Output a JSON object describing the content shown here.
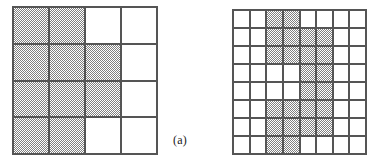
{
  "figure": {
    "panel_label": "(a)",
    "colors": {
      "grid_line": "#555555",
      "shade_fill": "#808080",
      "empty_fill": "#ffffff",
      "label_text": "#1a1a1a"
    }
  },
  "chart_data": {
    "type": "heatmap",
    "title": "",
    "subtitle": "",
    "xlabel": "",
    "ylabel": "",
    "grid": true,
    "legend": "none",
    "annotations": [
      {
        "text": "(a)",
        "x": 173,
        "y": 133
      }
    ],
    "panels": [
      {
        "name": "coarse-grid",
        "rows": 8,
        "cols": 8,
        "display_rows": 4,
        "display_cols": 4,
        "cell_values_note": "1 = shaded cell, 0 = empty cell; row order top to bottom, column order left to right",
        "cells": [
          [
            1,
            1,
            0,
            0
          ],
          [
            1,
            1,
            1,
            0
          ],
          [
            1,
            1,
            1,
            0
          ],
          [
            1,
            1,
            0,
            0
          ]
        ],
        "shaded_count": 10,
        "total_count": 16
      },
      {
        "name": "fine-grid",
        "rows": 8,
        "cols": 8,
        "display_rows": 8,
        "display_cols": 8,
        "cell_values_note": "1 = shaded cell, 0 = empty cell; row order top to bottom, column order left to right",
        "cells": [
          [
            0,
            0,
            1,
            1,
            0,
            0,
            0,
            0
          ],
          [
            0,
            0,
            1,
            1,
            1,
            1,
            0,
            0
          ],
          [
            0,
            0,
            1,
            1,
            1,
            1,
            0,
            0
          ],
          [
            0,
            0,
            0,
            0,
            1,
            1,
            0,
            0
          ],
          [
            0,
            0,
            0,
            0,
            1,
            1,
            0,
            0
          ],
          [
            0,
            0,
            1,
            1,
            1,
            1,
            0,
            0
          ],
          [
            0,
            0,
            1,
            1,
            1,
            1,
            0,
            0
          ],
          [
            0,
            0,
            1,
            1,
            0,
            0,
            0,
            0
          ]
        ],
        "shaded_count": 24,
        "total_count": 64
      }
    ]
  }
}
